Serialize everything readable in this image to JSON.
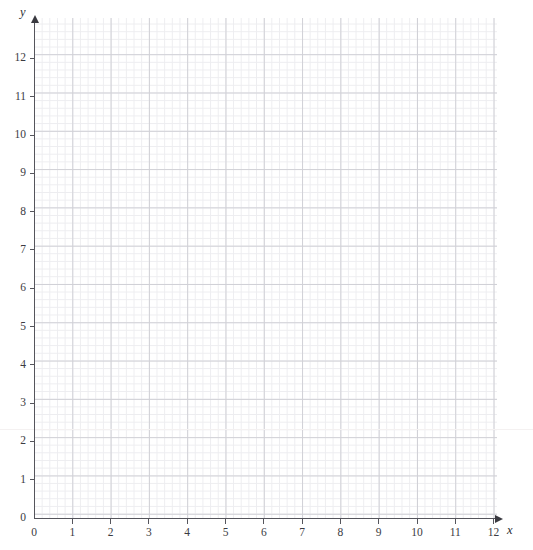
{
  "chart_data": {
    "type": "scatter",
    "title": "",
    "subtitle": "",
    "xlabel": "x",
    "ylabel": "y",
    "series": [],
    "annotations": [],
    "grid": true,
    "legend": false,
    "legend_position": "none",
    "x": [],
    "values": [],
    "xlim": [
      0,
      12.83
    ],
    "ylim": [
      0,
      12.83
    ],
    "x_ticks": [
      0,
      1,
      2,
      3,
      4,
      5,
      6,
      7,
      8,
      9,
      10,
      11,
      12
    ],
    "y_ticks": [
      0,
      1,
      2,
      3,
      4,
      5,
      6,
      7,
      8,
      9,
      10,
      11,
      12
    ],
    "x_tick_labels": [
      "0",
      "1",
      "2",
      "3",
      "4",
      "5",
      "6",
      "7",
      "8",
      "9",
      "10",
      "11",
      "12"
    ],
    "y_tick_labels": [
      "0",
      "1",
      "2",
      "3",
      "4",
      "5",
      "6",
      "7",
      "8",
      "9",
      "10",
      "11",
      "12"
    ],
    "major_step": 1,
    "minor_per_major": 5
  },
  "axes": {
    "x_label": "x",
    "y_label": "y",
    "origin_label": "0"
  },
  "colors": {
    "minor_grid": "#ededf0",
    "major_grid": "#d0d0d6",
    "axis": "#55555c",
    "arrow": "#3a3a40",
    "tick_label": "#3b3b42",
    "background": "#ffffff"
  },
  "geometry": {
    "origin_x_px": 34,
    "origin_y_px": 518,
    "unit_px": 38.3,
    "grid_right_px": 497,
    "grid_top_px": 18
  }
}
